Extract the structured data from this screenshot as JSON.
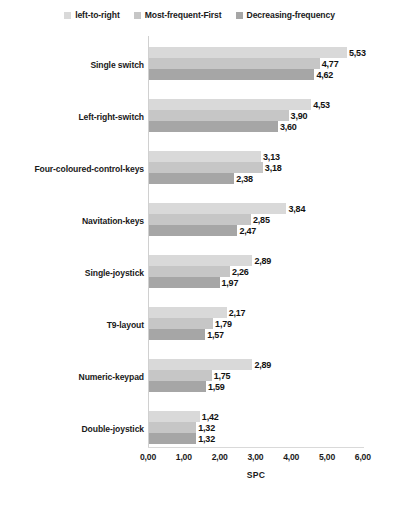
{
  "chart_data": {
    "type": "bar",
    "orientation": "horizontal",
    "title": "",
    "xlabel": "SPC",
    "ylabel": "",
    "xlim": [
      0,
      6
    ],
    "xticks": [
      "0,00",
      "1,00",
      "2,00",
      "3,00",
      "4,00",
      "5,00",
      "6,00"
    ],
    "xtick_values": [
      0,
      1,
      2,
      3,
      4,
      5,
      6
    ],
    "grid": false,
    "legend_position": "top-center",
    "decimal_separator": ",",
    "categories": [
      "Single switch",
      "Left-right-switch",
      "Four-coloured-control-keys",
      "Navitation-keys",
      "Single-joystick",
      "T9-layout",
      "Numeric-keypad",
      "Double-joystick"
    ],
    "series": [
      {
        "name": "left-to-right",
        "color": "#d9d9d9",
        "values": [
          5.53,
          4.53,
          3.13,
          3.84,
          2.89,
          2.17,
          2.89,
          1.42
        ],
        "labels": [
          "5,53",
          "4,53",
          "3,13",
          "3,84",
          "2,89",
          "2,17",
          "2,89",
          "1,42"
        ]
      },
      {
        "name": "Most-frequent-First",
        "color": "#c6c6c6",
        "values": [
          4.77,
          3.9,
          3.18,
          2.85,
          2.26,
          1.79,
          1.75,
          1.32
        ],
        "labels": [
          "4,77",
          "3,90",
          "3,18",
          "2,85",
          "2,26",
          "1,79",
          "1,75",
          "1,32"
        ]
      },
      {
        "name": "Decreasing-frequency",
        "color": "#a6a6a6",
        "values": [
          4.62,
          3.6,
          2.38,
          2.47,
          1.97,
          1.57,
          1.59,
          1.32
        ],
        "labels": [
          "4,62",
          "3,60",
          "2,38",
          "2,47",
          "1,97",
          "1,57",
          "1,59",
          "1,32"
        ]
      }
    ]
  },
  "legend": {
    "items": [
      {
        "label": "left-to-right",
        "color": "#d9d9d9"
      },
      {
        "label": "Most-frequent-First",
        "color": "#c6c6c6"
      },
      {
        "label": "Decreasing-frequency",
        "color": "#a6a6a6"
      }
    ]
  }
}
